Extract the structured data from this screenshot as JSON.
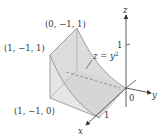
{
  "figure": {
    "axes": {
      "x_label": "x",
      "y_label": "y",
      "z_label": "z",
      "origin_label": "0",
      "z_tick_label": "1",
      "x_tick_label": "1"
    },
    "points": {
      "top_vertex": "(0, −1, 1)",
      "upper_left_vertex": "(1, −1, 1)",
      "lower_left_vertex": "(1, −1, 0)"
    },
    "surface_label": {
      "lhs": "z",
      "eq": " = ",
      "rhs_base": "y",
      "rhs_exp": "2"
    },
    "colors": {
      "solid_fill": "#e4e4e4",
      "face_fill": "#d6d6d6",
      "edge": "#9a9a9a",
      "axis": "#333333"
    }
  }
}
